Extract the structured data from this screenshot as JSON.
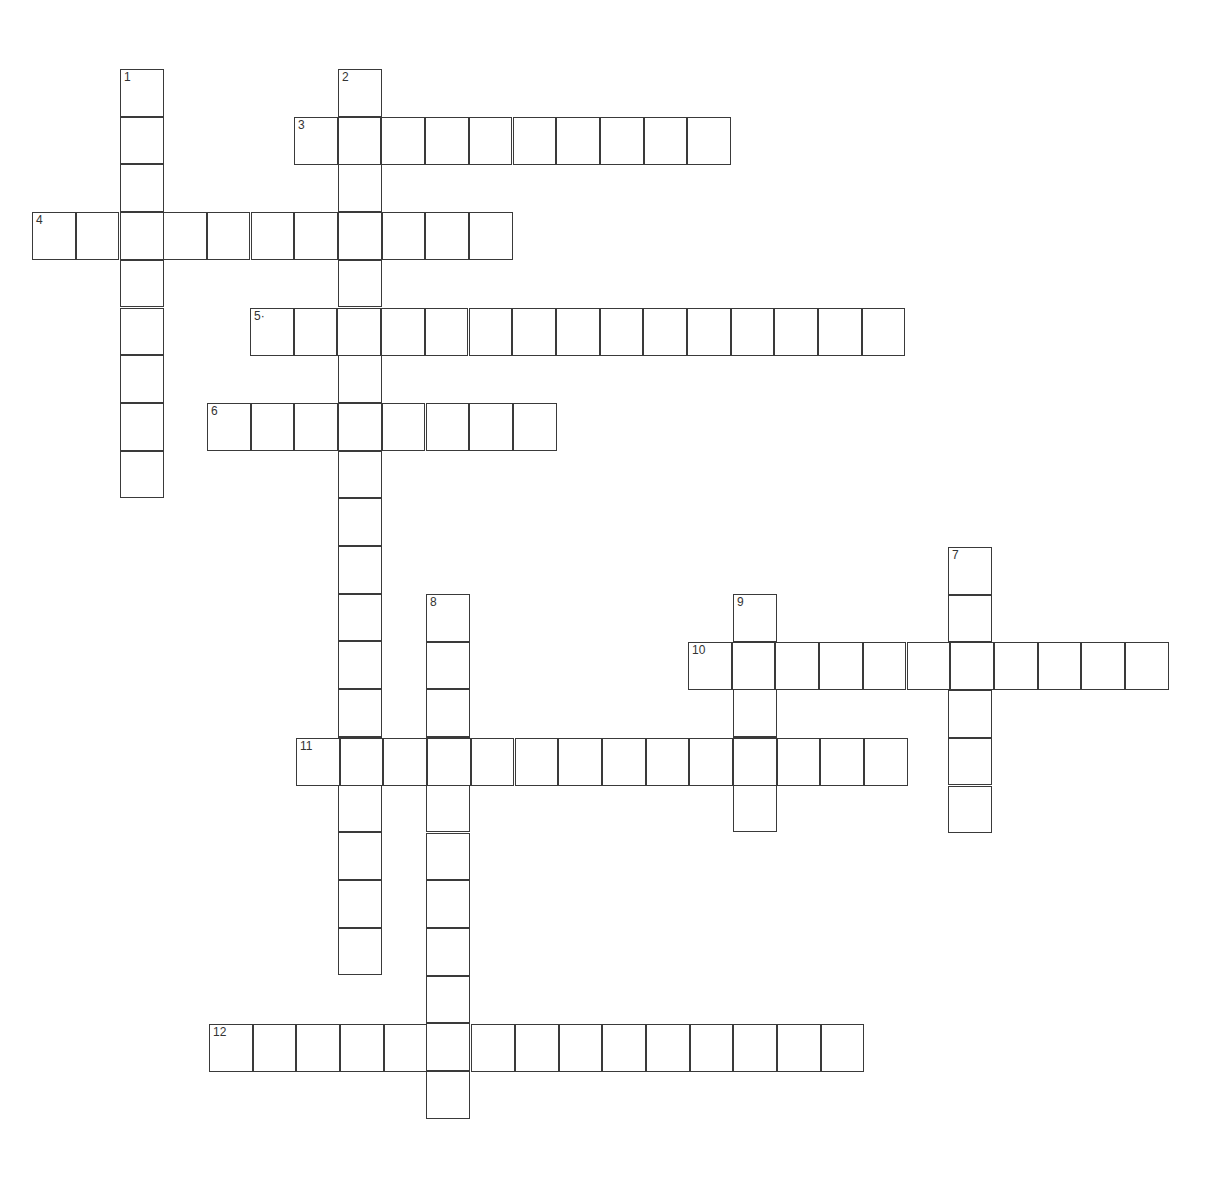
{
  "puzzle": {
    "type": "crossword",
    "cell_width": 43.7,
    "cell_height": 47.7,
    "words": [
      {
        "number": "1",
        "label": "1",
        "direction": "down",
        "x": 120,
        "y": 69,
        "length": 9
      },
      {
        "number": "2",
        "label": "2",
        "direction": "down",
        "x": 338,
        "y": 69,
        "length": 19
      },
      {
        "number": "3",
        "label": "3",
        "direction": "across",
        "x": 294,
        "y": 117,
        "length": 10
      },
      {
        "number": "4",
        "label": "4",
        "direction": "across",
        "x": 32,
        "y": 212,
        "length": 11
      },
      {
        "number": "5",
        "label": "5·",
        "direction": "across",
        "x": 250,
        "y": 308,
        "length": 15
      },
      {
        "number": "6",
        "label": "6",
        "direction": "across",
        "x": 207,
        "y": 403,
        "length": 8
      },
      {
        "number": "7",
        "label": "7",
        "direction": "down",
        "x": 948,
        "y": 547,
        "length": 6
      },
      {
        "number": "8",
        "label": "8",
        "direction": "down",
        "x": 426,
        "y": 594,
        "length": 11
      },
      {
        "number": "9",
        "label": "9",
        "direction": "down",
        "x": 733,
        "y": 594,
        "length": 5
      },
      {
        "number": "10",
        "label": "10",
        "direction": "across",
        "x": 688,
        "y": 642,
        "length": 11
      },
      {
        "number": "11",
        "label": "11",
        "direction": "across",
        "x": 296,
        "y": 738,
        "length": 14
      },
      {
        "number": "12",
        "label": "12",
        "direction": "across",
        "x": 209,
        "y": 1024,
        "length": 15
      }
    ]
  }
}
